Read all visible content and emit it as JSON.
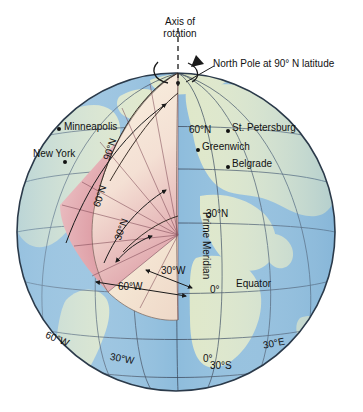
{
  "figure": {
    "title_axis_line1": "Axis of",
    "title_axis_line2": "rotation",
    "north_pole_callout": "North Pole at 90° N latitude"
  },
  "cities": [
    {
      "name": "Minneapolis",
      "dot_x": 57,
      "dot_y": 127,
      "label_x": 64,
      "label_y": 121
    },
    {
      "name": "New York",
      "dot_x": 63,
      "dot_y": 160,
      "label_x": 33,
      "label_y": 148
    },
    {
      "name": "St. Petersburg",
      "dot_x": 226,
      "dot_y": 129,
      "label_x": 232,
      "label_y": 122
    },
    {
      "name": "Greenwich",
      "dot_x": 196,
      "dot_y": 148,
      "label_x": 202,
      "label_y": 141
    },
    {
      "name": "Belgrade",
      "dot_x": 226,
      "dot_y": 165,
      "label_x": 232,
      "label_y": 158
    }
  ],
  "graticule_labels": [
    {
      "id": "lat-60n-surface",
      "text": "60°N",
      "x": 189,
      "y": 124,
      "rot": 0
    },
    {
      "id": "lat-30n-surface",
      "text": "30°N",
      "x": 206,
      "y": 208,
      "rot": 0
    },
    {
      "id": "lat-0-surface",
      "text": "0°",
      "x": 210,
      "y": 284,
      "rot": 0
    },
    {
      "id": "equator",
      "text": "Equator",
      "x": 236,
      "y": 278,
      "rot": 0
    },
    {
      "id": "prime-meridian",
      "text": "Prime Meridian",
      "x": 212,
      "y": 212,
      "rot": 90
    },
    {
      "id": "lon-60w",
      "text": "60°W",
      "x": 48,
      "y": 329,
      "rot": 22
    },
    {
      "id": "lon-30w",
      "text": "30°W",
      "x": 111,
      "y": 351,
      "rot": 10
    },
    {
      "id": "lon-0-south",
      "text": "0°",
      "x": 203,
      "y": 353,
      "rot": 0
    },
    {
      "id": "lat-30s",
      "text": "30°S",
      "x": 210,
      "y": 360,
      "rot": 0
    },
    {
      "id": "lon-30e",
      "text": "30°E",
      "x": 262,
      "y": 340,
      "rot": -12
    }
  ],
  "wedge_labels": [
    {
      "id": "arc-90n",
      "text": "90°N",
      "x": 101,
      "y": 158,
      "rot": -72
    },
    {
      "id": "arc-60n",
      "text": "60°N",
      "x": 91,
      "y": 205,
      "rot": -72
    },
    {
      "id": "arc-30n",
      "text": "30°N",
      "x": 112,
      "y": 238,
      "rot": -70
    },
    {
      "id": "arc-30w",
      "text": "30°W",
      "x": 161,
      "y": 265,
      "rot": 0
    },
    {
      "id": "arc-60w",
      "text": "60°W",
      "x": 118,
      "y": 281,
      "rot": 0
    }
  ],
  "colors": {
    "ocean": "#8fbcdc",
    "land": "#dee7c8",
    "outline": "#2b3a4a",
    "graticule": "#3b4a5c",
    "wedge_light": "#f6e9d4",
    "wedge_pink": "#d98b96",
    "wedge_pale": "#f3d5d6",
    "leader": "#000000"
  },
  "geometry": {
    "center_x": 176,
    "center_y": 232,
    "radius": 165,
    "pole_x": 178,
    "pole_y": 73,
    "core_x": 178,
    "core_y": 235
  }
}
